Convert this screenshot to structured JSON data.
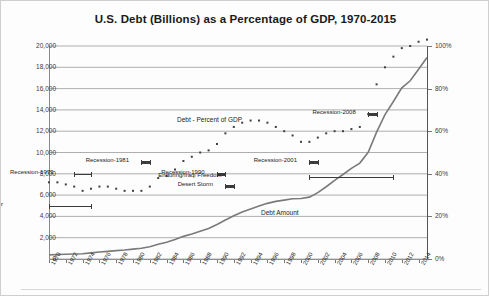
{
  "chart": {
    "title": "U.S. Debt (Billions) as a Percentage of GDP, 1970-2015"
  },
  "series_labels": {
    "gdp_percent": "Debt - Percent of GDP",
    "debt_amount": "Debt Amount"
  },
  "annotations": [
    {
      "name": "vietnam-war",
      "text": "Vietnam War",
      "start": 1970,
      "end": 1975,
      "level": 5000
    },
    {
      "name": "recession-1973",
      "text": "Recession-1973",
      "start": 1973,
      "end": 1975,
      "level": 8000
    },
    {
      "name": "recession-1981",
      "text": "Recession-1981",
      "start": 1981,
      "end": 1982,
      "level": 9100
    },
    {
      "name": "recession-1990",
      "text": "Recession-1990",
      "start": 1990,
      "end": 1991,
      "level": 8000
    },
    {
      "name": "desert-storm",
      "text": "Desert Storm",
      "start": 1991,
      "end": 1992,
      "level": 6900
    },
    {
      "name": "recession-2001",
      "text": "Recession-2001",
      "start": 2001,
      "end": 2002,
      "level": 9100
    },
    {
      "name": "enduring-iraqi-freedom",
      "text": "Enduring/Iraqi Freedom",
      "start": 2001,
      "end": 2011,
      "level": 7700
    },
    {
      "name": "recession-2008",
      "text": "Recession-2008",
      "start": 2008,
      "end": 2009,
      "level": 13600
    }
  ],
  "chart_data": {
    "type": "line",
    "title": "U.S. Debt (Billions) as a Percentage of GDP, 1970-2015",
    "xlabel": "",
    "ylabel": "",
    "xlim": [
      1970,
      2015
    ],
    "ylim": [
      0,
      20000
    ],
    "y2lim": [
      0,
      100
    ],
    "grid": true,
    "legend": "inline-labels",
    "xticks": [
      1970,
      1972,
      1974,
      1976,
      1978,
      1980,
      1982,
      1984,
      1986,
      1988,
      1990,
      1992,
      1994,
      1996,
      1998,
      2000,
      2002,
      2004,
      2006,
      2008,
      2010,
      2012,
      2014
    ],
    "yticks": [
      0,
      2000,
      4000,
      6000,
      8000,
      10000,
      12000,
      14000,
      16000,
      18000,
      20000
    ],
    "ytick_labels": [
      "0",
      "2,000",
      "4,000",
      "6,000",
      "8,000",
      "10,000",
      "12,000",
      "14,000",
      "16,000",
      "18,000",
      "20,000"
    ],
    "y2ticks": [
      0,
      20,
      40,
      60,
      80,
      100
    ],
    "y2tick_labels": [
      "0%",
      "20%",
      "40%",
      "60%",
      "80%",
      "100%"
    ],
    "x": [
      1970,
      1971,
      1972,
      1973,
      1974,
      1975,
      1976,
      1977,
      1978,
      1979,
      1980,
      1981,
      1982,
      1983,
      1984,
      1985,
      1986,
      1987,
      1988,
      1989,
      1990,
      1991,
      1992,
      1993,
      1994,
      1995,
      1996,
      1997,
      1998,
      1999,
      2000,
      2001,
      2002,
      2003,
      2004,
      2005,
      2006,
      2007,
      2008,
      2009,
      2010,
      2011,
      2012,
      2013,
      2014,
      2015
    ],
    "series": [
      {
        "name": "Debt Amount",
        "axis": "left",
        "unit": "Billions USD",
        "style": "solid",
        "color": "#7a7a7a",
        "values": [
          389,
          424,
          449,
          470,
          492,
          576,
          654,
          719,
          789,
          846,
          930,
          1004,
          1147,
          1382,
          1573,
          1823,
          2125,
          2350,
          2602,
          2857,
          3233,
          3665,
          4065,
          4411,
          4693,
          4974,
          5225,
          5413,
          5526,
          5656,
          5674,
          5807,
          6228,
          6783,
          7379,
          7933,
          8507,
          9008,
          10025,
          11910,
          13562,
          14790,
          16066,
          16738,
          17824,
          18922
        ]
      },
      {
        "name": "Debt - Percent of GDP",
        "axis": "right",
        "unit": "percent",
        "style": "dotted",
        "color": "#404040",
        "values": [
          36,
          36,
          35,
          34,
          32,
          33,
          34,
          34,
          33,
          32,
          32,
          32,
          34,
          38,
          39,
          42,
          46,
          48,
          50,
          51,
          54,
          59,
          62,
          64,
          65,
          65,
          64,
          62,
          60,
          58,
          55,
          55,
          57,
          59,
          60,
          60,
          61,
          62,
          68,
          82,
          90,
          95,
          99,
          100,
          102,
          103
        ]
      }
    ]
  }
}
